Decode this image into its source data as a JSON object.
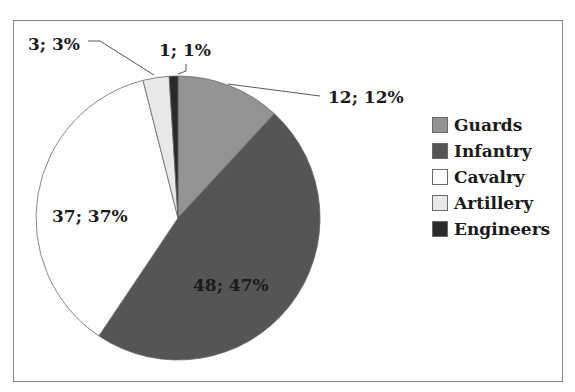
{
  "chart_data": {
    "type": "pie",
    "title": "",
    "categories": [
      "Guards",
      "Infantry",
      "Cavalry",
      "Artillery",
      "Engineers"
    ],
    "values": [
      12,
      48,
      37,
      3,
      1
    ],
    "percentages": [
      12,
      47,
      37,
      3,
      1
    ],
    "colors": [
      "#939393",
      "#555555",
      "#fdfdfd",
      "#e8e8e8",
      "#2a2a2a"
    ],
    "data_labels": [
      "12; 12%",
      "48; 47%",
      "37; 37%",
      "3; 3%",
      "1; 1%"
    ],
    "legend_position": "right",
    "start_angle": "12 o'clock, clockwise"
  },
  "legend": {
    "items": [
      {
        "label": "Guards",
        "color": "#939393"
      },
      {
        "label": "Infantry",
        "color": "#555555"
      },
      {
        "label": "Cavalry",
        "color": "#fdfdfd"
      },
      {
        "label": "Artillery",
        "color": "#e8e8e8"
      },
      {
        "label": "Engineers",
        "color": "#2a2a2a"
      }
    ]
  }
}
